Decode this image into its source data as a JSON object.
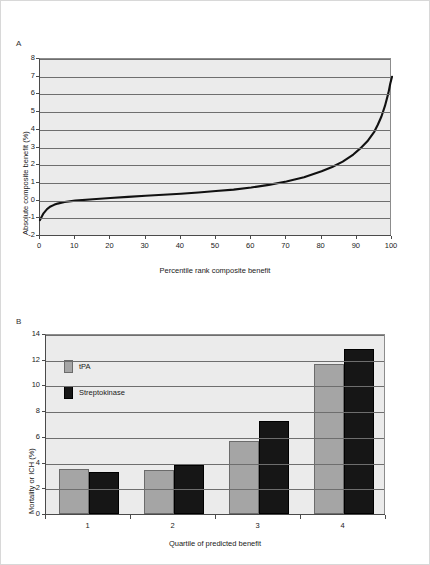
{
  "figure": {
    "background": "#ffffff",
    "border_color": "#d8d8d8",
    "plot_background": "#ebebeb",
    "gridline_color": "#6e6e6e",
    "axis_color": "#4a4a4a"
  },
  "panels": [
    {
      "label": "A"
    },
    {
      "label": "B"
    }
  ],
  "chart_data": [
    {
      "type": "line",
      "panel": "A",
      "title": "",
      "xlabel": "Percentile rank composite benefit",
      "ylabel": "Absolute composite benefit (%)",
      "xlim": [
        0,
        100
      ],
      "ylim": [
        -2,
        8
      ],
      "xticks": [
        0,
        10,
        20,
        30,
        40,
        50,
        60,
        70,
        80,
        90,
        100
      ],
      "xtick_labels": [
        "0",
        "10",
        "20",
        "30",
        "40",
        "50",
        "60",
        "70",
        "80",
        "90",
        "100"
      ],
      "yticks": [
        -2,
        -1,
        0,
        1,
        2,
        3,
        4,
        5,
        6,
        7,
        8
      ],
      "ytick_labels": [
        "-2",
        "-1",
        "0",
        "1",
        "2",
        "3",
        "4",
        "5",
        "6",
        "7",
        "8"
      ],
      "grid": true,
      "legend": "none",
      "line_color": "#111111",
      "series": [
        {
          "name": "Absolute composite benefit",
          "x": [
            0,
            1,
            2,
            3,
            4,
            5,
            7,
            10,
            15,
            20,
            25,
            30,
            35,
            40,
            45,
            50,
            55,
            60,
            65,
            70,
            75,
            80,
            83,
            86,
            89,
            91,
            93,
            95,
            96,
            97,
            98,
            99,
            99.5,
            100
          ],
          "values": [
            -1.1,
            -0.72,
            -0.48,
            -0.33,
            -0.24,
            -0.17,
            -0.08,
            0.0,
            0.08,
            0.15,
            0.21,
            0.27,
            0.33,
            0.39,
            0.46,
            0.54,
            0.62,
            0.74,
            0.89,
            1.08,
            1.32,
            1.66,
            1.9,
            2.2,
            2.6,
            2.95,
            3.35,
            3.9,
            4.3,
            4.75,
            5.35,
            6.1,
            6.6,
            7.0
          ]
        }
      ]
    },
    {
      "type": "bar",
      "panel": "B",
      "title": "",
      "xlabel": "Quartile of predicted benefit",
      "ylabel": "Mortality or ICH (%)",
      "categories": [
        "1",
        "2",
        "3",
        "4"
      ],
      "ylim": [
        0,
        14
      ],
      "yticks": [
        0,
        2,
        4,
        6,
        8,
        10,
        12,
        14
      ],
      "ytick_labels": [
        "0",
        "2",
        "4",
        "6",
        "8",
        "10",
        "12",
        "14"
      ],
      "grid": true,
      "legend": "inside-top-left",
      "series": [
        {
          "name": "tPA",
          "color": "#a5a5a5",
          "values": [
            3.5,
            3.4,
            5.65,
            11.7
          ]
        },
        {
          "name": "Streptokinase",
          "color": "#161616",
          "values": [
            3.25,
            3.8,
            7.2,
            12.8
          ]
        }
      ]
    }
  ]
}
